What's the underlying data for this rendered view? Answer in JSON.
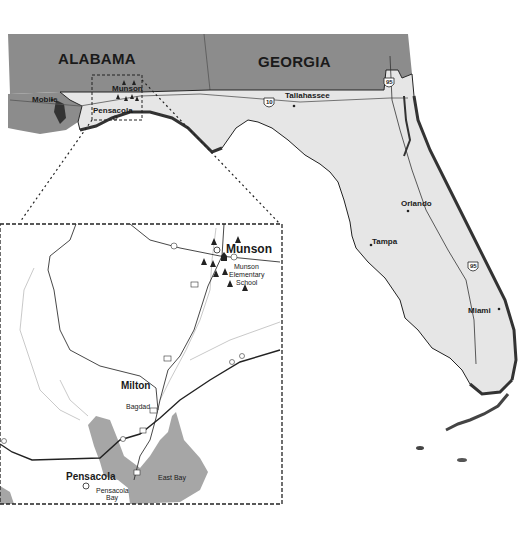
{
  "map": {
    "states": [
      {
        "label": "ALABAMA",
        "fill": "#8c8c8c"
      },
      {
        "label": "GEORGIA",
        "fill": "#8c8c8c"
      }
    ],
    "florida_fill": "#e6e6e6",
    "water_fill": "#ffffff",
    "coast_shadow": "#333333",
    "cities": [
      {
        "label": "Mobile"
      },
      {
        "label": "Munson"
      },
      {
        "label": "Pensacola"
      },
      {
        "label": "Tallahassee"
      },
      {
        "label": "Orlando"
      },
      {
        "label": "Tampa"
      },
      {
        "label": "Miami"
      }
    ],
    "interstates": [
      {
        "label": "10"
      },
      {
        "label": "95"
      },
      {
        "label": "95"
      }
    ]
  },
  "inset": {
    "labels": {
      "munson": "Munson",
      "school": "Munson Elementary School",
      "school_line1": "Munson",
      "school_line2": "Elementary",
      "school_line3": "School",
      "milton": "Milton",
      "bagdad": "Bagdad",
      "pensacola": "Pensacola",
      "pensacola_bay_1": "Pensacola",
      "pensacola_bay_2": "Bay",
      "east_bay": "East Bay"
    },
    "road_markers": [
      "4",
      "4",
      "191",
      "191",
      "87",
      "90",
      "10",
      "90",
      "191",
      "191",
      "8"
    ],
    "bay_fill": "#a6a6a6"
  }
}
